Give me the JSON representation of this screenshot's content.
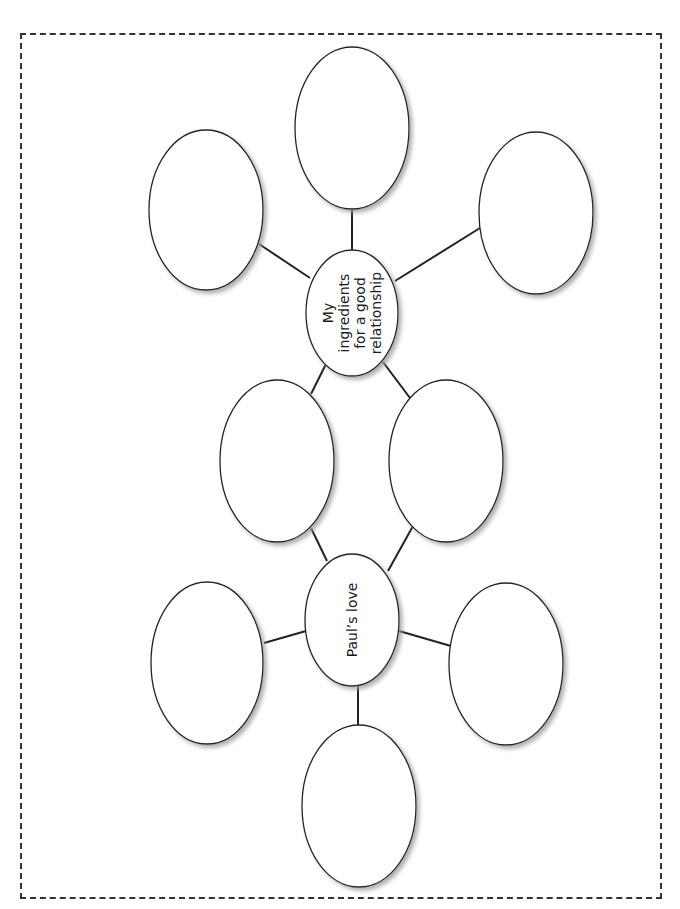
{
  "worksheet": {
    "type": "bubble-map",
    "orientation": "rotated-90-ccw",
    "border": "dashed",
    "colors": {
      "stroke": "#222222",
      "fill": "#ffffff",
      "shadow": "#9a9a9a",
      "border": "#333333"
    }
  },
  "nodes": [
    {
      "id": "center-ingredients",
      "role": "central",
      "label_lines": [
        "My",
        "ingredients",
        "for a good",
        "relationship"
      ],
      "cx": 352,
      "cy": 313,
      "rx": 46,
      "ry": 63
    },
    {
      "id": "center-pauls-love",
      "role": "central",
      "label_lines": [
        "Paul’s love"
      ],
      "cx": 352,
      "cy": 620,
      "rx": 47,
      "ry": 66
    },
    {
      "id": "top",
      "role": "blank",
      "label_lines": [],
      "cx": 352,
      "cy": 128,
      "rx": 57,
      "ry": 81
    },
    {
      "id": "top-left",
      "role": "blank",
      "label_lines": [],
      "cx": 206,
      "cy": 210,
      "rx": 57,
      "ry": 80
    },
    {
      "id": "top-right",
      "role": "blank",
      "label_lines": [],
      "cx": 536,
      "cy": 213,
      "rx": 57,
      "ry": 81
    },
    {
      "id": "mid-left",
      "role": "shared-blank",
      "label_lines": [],
      "cx": 277,
      "cy": 461,
      "rx": 57,
      "ry": 81
    },
    {
      "id": "mid-right",
      "role": "shared-blank",
      "label_lines": [],
      "cx": 446,
      "cy": 461,
      "rx": 57,
      "ry": 81
    },
    {
      "id": "bottom-left",
      "role": "blank",
      "label_lines": [],
      "cx": 207,
      "cy": 663,
      "rx": 56,
      "ry": 81
    },
    {
      "id": "bottom-right",
      "role": "blank",
      "label_lines": [],
      "cx": 506,
      "cy": 664,
      "rx": 57,
      "ry": 81
    },
    {
      "id": "bottom",
      "role": "blank",
      "label_lines": [],
      "cx": 359,
      "cy": 806,
      "rx": 57,
      "ry": 81
    }
  ],
  "edges": [
    {
      "from": "center-ingredients",
      "to": "top",
      "x1": 352,
      "y1": 250,
      "x2": 352,
      "y2": 209
    },
    {
      "from": "center-ingredients",
      "to": "top-left",
      "x1": 310,
      "y1": 278,
      "x2": 259,
      "y2": 244
    },
    {
      "from": "center-ingredients",
      "to": "top-right",
      "x1": 395,
      "y1": 281,
      "x2": 480,
      "y2": 228
    },
    {
      "from": "center-ingredients",
      "to": "mid-left",
      "x1": 326,
      "y1": 364,
      "x2": 311,
      "y2": 394
    },
    {
      "from": "center-ingredients",
      "to": "mid-right",
      "x1": 383,
      "y1": 362,
      "x2": 410,
      "y2": 398
    },
    {
      "from": "center-pauls-love",
      "to": "mid-left",
      "x1": 327,
      "y1": 561,
      "x2": 311,
      "y2": 528
    },
    {
      "from": "center-pauls-love",
      "to": "mid-right",
      "x1": 388,
      "y1": 571,
      "x2": 413,
      "y2": 526
    },
    {
      "from": "center-pauls-love",
      "to": "bottom-left",
      "x1": 306,
      "y1": 631,
      "x2": 264,
      "y2": 643
    },
    {
      "from": "center-pauls-love",
      "to": "bottom-right",
      "x1": 399,
      "y1": 631,
      "x2": 451,
      "y2": 646
    },
    {
      "from": "center-pauls-love",
      "to": "bottom",
      "x1": 358,
      "y1": 686,
      "x2": 358,
      "y2": 725
    }
  ]
}
